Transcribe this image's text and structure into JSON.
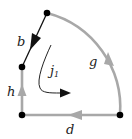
{
  "diagram": {
    "type": "contour-path",
    "colors": {
      "edge_gray": "#a8a8a8",
      "edge_black": "#111111",
      "node": "#000000",
      "label": "#222222"
    },
    "nodes": [
      {
        "id": "top",
        "x": 47,
        "y": 13
      },
      {
        "id": "left-middle",
        "x": 22,
        "y": 67
      },
      {
        "id": "bottom-left",
        "x": 22,
        "y": 115
      },
      {
        "id": "bottom-right",
        "x": 120,
        "y": 115
      }
    ],
    "edges": [
      {
        "id": "b",
        "label": "b",
        "from": "top",
        "to": "left-middle",
        "shape": "line",
        "color": "black",
        "arrow": "toward left-middle"
      },
      {
        "id": "h",
        "label": "h",
        "from": "bottom-left",
        "to": "left-middle",
        "shape": "line",
        "color": "gray",
        "arrow": "upward"
      },
      {
        "id": "d",
        "label": "d",
        "from": "bottom-right",
        "to": "bottom-left",
        "shape": "line",
        "color": "gray",
        "arrow": "leftward"
      },
      {
        "id": "g",
        "label": "g",
        "from": "bottom-right",
        "to": "top",
        "shape": "arc",
        "color": "gray",
        "arrow": "upward along arc"
      }
    ],
    "current": {
      "label": "j",
      "subscript": "1",
      "shape": "curved arrow",
      "direction": "down then right"
    }
  },
  "labels": {
    "b": "b",
    "h": "h",
    "d": "d",
    "g": "g",
    "j_main": "j",
    "j_sub": "1"
  }
}
